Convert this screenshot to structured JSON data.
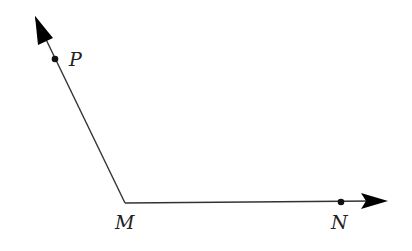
{
  "diagram": {
    "type": "angle",
    "vertex": {
      "label": "M",
      "x": 125,
      "y": 203
    },
    "rays": [
      {
        "name": "ray-MP",
        "from": "M",
        "through": "P",
        "point": {
          "label": "P",
          "x": 55,
          "y": 59
        },
        "arrow_tip": {
          "x": 35,
          "y": 16
        }
      },
      {
        "name": "ray-MN",
        "from": "M",
        "through": "N",
        "point": {
          "label": "N",
          "x": 341,
          "y": 202
        },
        "arrow_tip": {
          "x": 388,
          "y": 201
        }
      }
    ],
    "labels": {
      "P": "P",
      "M": "M",
      "N": "N"
    },
    "colors": {
      "line": "#333333",
      "point": "#111111",
      "arrow": "#000000",
      "text": "#222222",
      "background": "#ffffff"
    }
  }
}
